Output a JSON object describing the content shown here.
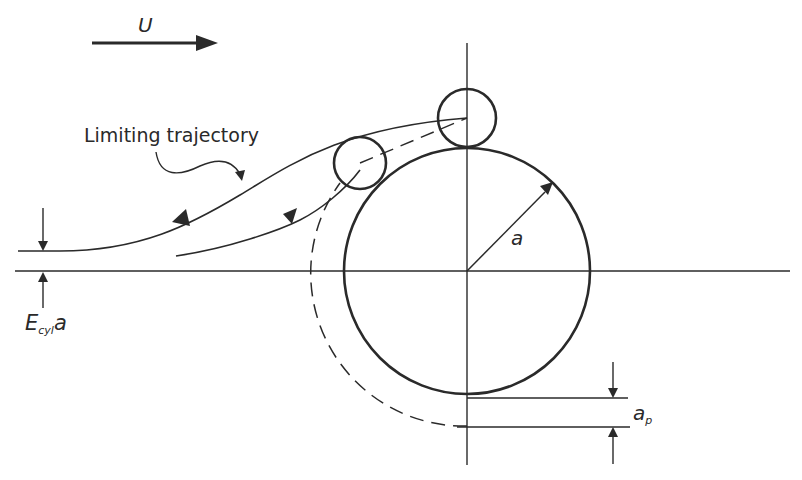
{
  "figure": {
    "flow_label": "U",
    "trajectory_label": "Limiting trajectory",
    "radius_label": "a",
    "offset_label_main": "E",
    "offset_label_sub": "cyl",
    "offset_label_tail": "a",
    "particle_radius_label_main": "a",
    "particle_radius_label_sub": "p"
  },
  "colors": {
    "ink": "#2a2a2a",
    "background": "#ffffff"
  }
}
